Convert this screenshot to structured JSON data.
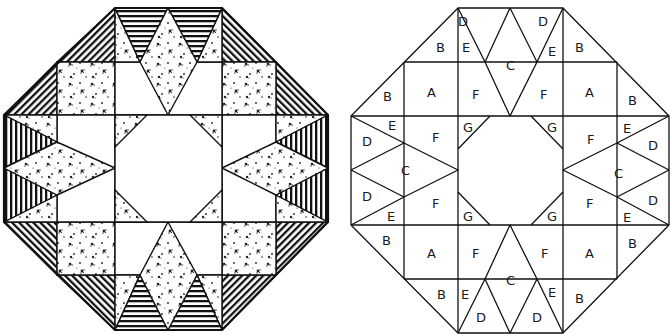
{
  "figure": {
    "panels": [
      {
        "id": "shaded-block",
        "description": "Octagonal quilt block shown with fabric patterns"
      },
      {
        "id": "labeled-block",
        "description": "Same octagonal quilt block with piece labels"
      }
    ],
    "colors": {
      "line": "#111111",
      "background": "#ffffff",
      "stripe": "#111111",
      "print": "#222222"
    },
    "fabrics": {
      "A": "print",
      "B": "diagonal-stripe",
      "C": "print",
      "D": "stripe",
      "E": "print",
      "F": "plain",
      "G": "print"
    }
  },
  "labels": {
    "top": [
      "D",
      "D",
      "B",
      "E",
      "C",
      "E",
      "B"
    ],
    "upper": [
      "B",
      "A",
      "F",
      "F",
      "A",
      "B"
    ],
    "left": [
      "E",
      "D",
      "F",
      "G",
      "C",
      "D",
      "E",
      "F",
      "G"
    ],
    "right": [
      "G",
      "F",
      "E",
      "D",
      "C",
      "G",
      "F",
      "D",
      "E"
    ],
    "lower": [
      "B",
      "A",
      "F",
      "F",
      "A",
      "B"
    ],
    "bottom": [
      "B",
      "E",
      "C",
      "E",
      "B",
      "D",
      "D"
    ]
  }
}
